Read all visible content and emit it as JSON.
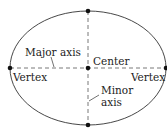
{
  "diagram": {
    "type": "ellipse-anatomy",
    "labels": {
      "major_axis": "Major axis",
      "center": "Center",
      "vertex_left": "Vertex",
      "vertex_right": "Vertex",
      "minor_axis_line1": "Minor",
      "minor_axis_line2": "axis"
    },
    "colors": {
      "stroke": "#333333",
      "dot": "#111111",
      "background": "#ffffff"
    }
  }
}
